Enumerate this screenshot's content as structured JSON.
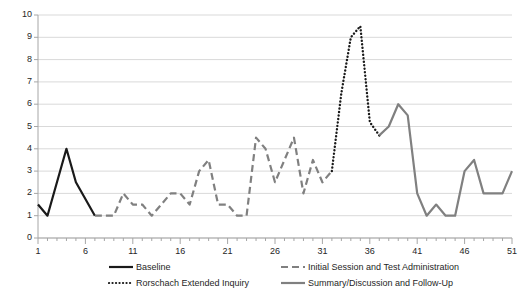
{
  "chart_data": {
    "type": "line",
    "title": "",
    "xlabel": "",
    "ylabel": "",
    "xlim": [
      1,
      51
    ],
    "ylim": [
      0,
      10
    ],
    "grid": true,
    "legend_position": "bottom",
    "y_ticks": [
      0,
      1,
      2,
      3,
      4,
      5,
      6,
      7,
      8,
      9,
      10
    ],
    "x_ticks": [
      1,
      6,
      11,
      16,
      21,
      26,
      31,
      36,
      41,
      46,
      51
    ],
    "x_minor_tick_step": 1,
    "series": [
      {
        "name": "Baseline",
        "style": "solid",
        "color": "#1a1a1a",
        "width": 2.2,
        "x": [
          1,
          2,
          4,
          5,
          7
        ],
        "values": [
          1.5,
          1.0,
          4.0,
          2.5,
          1.0
        ]
      },
      {
        "name": "Initial Session and Test Administration",
        "style": "dashed",
        "color": "#808080",
        "width": 2.2,
        "x": [
          7,
          8,
          9,
          10,
          11,
          12,
          13,
          14,
          15,
          16,
          17,
          18,
          19,
          20,
          21,
          22,
          23,
          24,
          25,
          26,
          27,
          28,
          29,
          30,
          31,
          32
        ],
        "values": [
          1.0,
          1.0,
          1.0,
          2.0,
          1.5,
          1.5,
          1.0,
          1.5,
          2.0,
          2.0,
          1.5,
          3.0,
          3.5,
          1.5,
          1.5,
          1.0,
          1.0,
          4.5,
          4.0,
          2.5,
          3.5,
          4.5,
          2.0,
          3.5,
          2.5,
          3.0
        ]
      },
      {
        "name": "Rorschach Extended Inquiry",
        "style": "dotted",
        "color": "#1a1a1a",
        "width": 2.4,
        "x": [
          32,
          33,
          34,
          35,
          36,
          37
        ],
        "values": [
          3.0,
          6.5,
          9.0,
          9.5,
          5.2,
          4.6
        ]
      },
      {
        "name": "Summary/Discussion and Follow-Up",
        "style": "solid",
        "color": "#808080",
        "width": 2.2,
        "x": [
          37,
          38,
          39,
          40,
          41,
          42,
          43,
          44,
          45,
          46,
          47,
          48,
          49,
          50,
          51
        ],
        "values": [
          4.6,
          5.0,
          6.0,
          5.5,
          2.0,
          1.0,
          1.5,
          1.0,
          1.0,
          3.0,
          3.5,
          2.0,
          2.0,
          2.0,
          3.0
        ]
      }
    ],
    "legend": [
      {
        "label": "Baseline",
        "style": "solid",
        "color": "#1a1a1a"
      },
      {
        "label": "Initial Session and Test Administration",
        "style": "dashed",
        "color": "#808080"
      },
      {
        "label": "Rorschach Extended Inquiry",
        "style": "dotted",
        "color": "#1a1a1a"
      },
      {
        "label": "Summary/Discussion and Follow-Up",
        "style": "solid",
        "color": "#808080"
      }
    ],
    "colors": {
      "gridline": "#d9d9d9",
      "axis": "#a6a6a6",
      "tick_text": "#262626",
      "plot_background": "#ffffff"
    }
  }
}
